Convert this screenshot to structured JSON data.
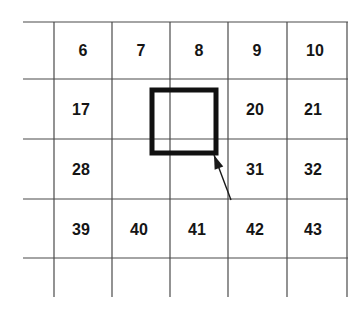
{
  "figure": {
    "type": "grid-diagram",
    "background_color": "#ffffff",
    "grid_line_color": "#4a4a4a",
    "highlight_color": "#111111",
    "text_color": "#151515"
  },
  "grid": {
    "columns": 5,
    "rows": 5,
    "vertical_line_x": [
      54,
      112,
      170,
      228,
      287,
      347
    ],
    "horizontal_line_y": [
      22,
      79,
      139,
      199,
      258
    ],
    "horizontal_line_x_start": 23,
    "horizontal_line_x_end": 348,
    "vertical_line_y_start": 22,
    "vertical_line_y_end": 297
  },
  "cells": [
    {
      "label": "6",
      "x": 83,
      "y": 51,
      "row": 1,
      "col": 1
    },
    {
      "label": "7",
      "x": 141,
      "y": 51,
      "row": 1,
      "col": 2
    },
    {
      "label": "8",
      "x": 199,
      "y": 51,
      "row": 1,
      "col": 3
    },
    {
      "label": "9",
      "x": 257,
      "y": 51,
      "row": 1,
      "col": 4
    },
    {
      "label": "10",
      "x": 315,
      "y": 51,
      "row": 1,
      "col": 5
    },
    {
      "label": "17",
      "x": 81,
      "y": 110,
      "row": 2,
      "col": 1
    },
    {
      "label": "20",
      "x": 255,
      "y": 110,
      "row": 2,
      "col": 4
    },
    {
      "label": "21",
      "x": 313,
      "y": 110,
      "row": 2,
      "col": 5
    },
    {
      "label": "28",
      "x": 81,
      "y": 170,
      "row": 3,
      "col": 1
    },
    {
      "label": "31",
      "x": 255,
      "y": 170,
      "row": 3,
      "col": 4
    },
    {
      "label": "32",
      "x": 313,
      "y": 170,
      "row": 3,
      "col": 5
    },
    {
      "label": "39",
      "x": 81,
      "y": 230,
      "row": 4,
      "col": 1
    },
    {
      "label": "40",
      "x": 139,
      "y": 230,
      "row": 4,
      "col": 2
    },
    {
      "label": "41",
      "x": 197,
      "y": 230,
      "row": 4,
      "col": 3
    },
    {
      "label": "42",
      "x": 255,
      "y": 230,
      "row": 4,
      "col": 4
    },
    {
      "label": "43",
      "x": 313,
      "y": 230,
      "row": 4,
      "col": 5
    }
  ],
  "highlight_box": {
    "x": 152,
    "y": 90,
    "width": 64,
    "height": 63,
    "stroke_width": 5,
    "stroke_color": "#111111"
  },
  "callout_arrow": {
    "tail_x": 231,
    "tail_y": 200,
    "tip_x": 214,
    "tip_y": 155,
    "stroke_width": 1.4,
    "stroke_color": "#1a1a1a"
  }
}
